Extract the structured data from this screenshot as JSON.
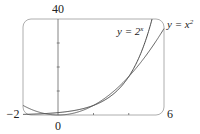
{
  "chart_data": {
    "type": "line",
    "title": "",
    "xlabel": "",
    "ylabel": "",
    "xlim": [
      -2,
      6
    ],
    "ylim": [
      0,
      40
    ],
    "x_tick_labels": [
      "−2",
      "0",
      "6"
    ],
    "y_tick_labels": [
      "40"
    ],
    "x_ticks": [
      2,
      4
    ],
    "y_ticks": [
      10,
      20,
      30
    ],
    "grid": false,
    "frame": "rounded-rectangle",
    "series": [
      {
        "name": "y = 2^x",
        "label_base": "y = 2",
        "label_exp": "x",
        "function": "2^x",
        "x": [
          -2,
          -1,
          0,
          1,
          2,
          3,
          4,
          5,
          5.32
        ],
        "y": [
          0.25,
          0.5,
          1,
          2,
          4,
          8,
          16,
          32,
          40
        ]
      },
      {
        "name": "y = x^2",
        "label_base": "y = x",
        "label_exp": "2",
        "function": "x^2",
        "x": [
          -2,
          -1,
          0,
          1,
          2,
          3,
          4,
          5,
          6
        ],
        "y": [
          4,
          1,
          0,
          1,
          4,
          9,
          16,
          25,
          36
        ]
      }
    ],
    "annotations": [
      {
        "text": "y = 2^x",
        "near": [
          4.4,
          34
        ]
      },
      {
        "text": "y = x^2",
        "near": [
          6.1,
          36
        ]
      }
    ]
  }
}
